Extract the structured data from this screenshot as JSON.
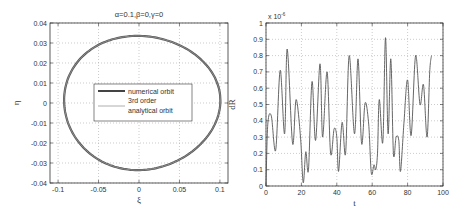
{
  "chart_data": [
    {
      "type": "line",
      "title": "α=0.1,β=0,γ=0",
      "xlabel": "ξ",
      "ylabel": "η",
      "xlim": [
        -0.11,
        0.11
      ],
      "ylim": [
        -0.04,
        0.04
      ],
      "xticks": [
        "-0.1",
        "-0.05",
        "0",
        "0.05",
        "0.1"
      ],
      "yticks": [
        "0.04",
        "0.03",
        "0.02",
        "0.01",
        "0",
        "-0.01",
        "-0.02",
        "-0.03",
        "-0.04"
      ],
      "grid": true,
      "legend": {
        "position": "center",
        "entries": [
          "numerical orbit",
          "3rd order analytical orbit"
        ],
        "entry_lines": [
          [
            "numerical orbit"
          ],
          [
            "3rd order",
            "analytical orbit"
          ]
        ]
      },
      "series": [
        {
          "name": "numerical orbit",
          "description": "closed orbit, approx ellipse centered ~(0.005, 0)",
          "x_extent": [
            -0.1,
            0.1
          ],
          "y_extent": [
            -0.034,
            0.034
          ]
        },
        {
          "name": "3rd order analytical orbit",
          "description": "overlaps numerical orbit",
          "x_extent": [
            -0.1,
            0.1
          ],
          "y_extent": [
            -0.034,
            0.034
          ]
        }
      ]
    },
    {
      "type": "line",
      "title": "",
      "xlabel": "t",
      "ylabel": "dR",
      "scale_label": "x 10",
      "scale_exponent": "-6",
      "xlim": [
        0,
        100
      ],
      "ylim": [
        0,
        1
      ],
      "xticks": [
        "0",
        "20",
        "40",
        "60",
        "80",
        "100"
      ],
      "yticks": [
        "1",
        "0.9",
        "0.8",
        "0.7",
        "0.6",
        "0.5",
        "0.4",
        "0.3",
        "0.2",
        "0.1",
        "0"
      ],
      "grid": true,
      "series": [
        {
          "name": "dR",
          "x": [
            0,
            1,
            3,
            5.5,
            8,
            10.5,
            12,
            15,
            17,
            19.5,
            21,
            22.5,
            24,
            26,
            28,
            30.5,
            32,
            34.5,
            36.5,
            38.5,
            40,
            41,
            43,
            45,
            47,
            50,
            52,
            54,
            56,
            58,
            59.5,
            61,
            62,
            63,
            64,
            66,
            67.5,
            69,
            70.5,
            72,
            73.5,
            75,
            76,
            78,
            80,
            82,
            84.5,
            87,
            89,
            91,
            92.5,
            93.5
          ],
          "y": [
            0,
            0.38,
            0.43,
            0.22,
            0.71,
            0.32,
            0.84,
            0.26,
            0.53,
            0.3,
            0.02,
            0.21,
            0.1,
            0.64,
            0.28,
            0.75,
            0.3,
            0.7,
            0.2,
            0.35,
            0.3,
            0.09,
            0.39,
            0.2,
            0.8,
            0.32,
            0.78,
            0.26,
            0.51,
            0.38,
            0.08,
            0.13,
            0.1,
            0.2,
            0.53,
            0.27,
            0.91,
            0.32,
            0.78,
            0.2,
            0.3,
            0.28,
            0.09,
            0.4,
            0.65,
            0.31,
            0.8,
            0.5,
            0.62,
            0.3,
            0.7,
            0.8
          ]
        }
      ]
    }
  ]
}
